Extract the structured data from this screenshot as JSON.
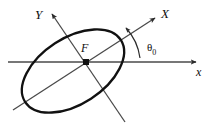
{
  "figure": {
    "type": "geometry-diagram",
    "background_color": "#ffffff",
    "ellipse_color": "#111111",
    "axis_color": "#4a4a4a",
    "label_color": "#0d0d0d",
    "labels": {
      "rotated_x_axis": "X",
      "rotated_y_axis": "Y",
      "horizontal_axis": "x",
      "focus": "F",
      "angle_symbol": "θ",
      "angle_subscript": "0"
    },
    "geometry": {
      "focus_point": [
        86,
        62
      ],
      "ellipse_semi_major": 57,
      "ellipse_semi_minor": 33,
      "ellipse_rotation_deg": -33,
      "rotated_x_axis_angle_deg": 33,
      "rotated_y_axis_angle_deg": 123,
      "horizontal_axis_y": 62,
      "horizontal_axis_start_x": 8,
      "horizontal_axis_end_x": 198,
      "arc_radius": 50
    }
  }
}
